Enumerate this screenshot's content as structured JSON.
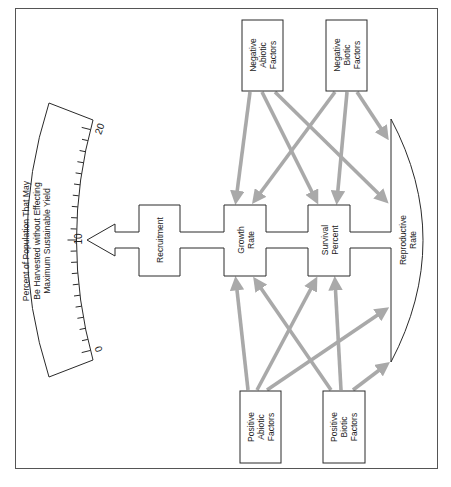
{
  "scale": {
    "label_lines": [
      "Percent of Population That May",
      "Be Harvested without Effecting",
      "Maximum Sustainable Yield"
    ],
    "ticks": [
      "0",
      "10",
      "20"
    ],
    "min": 0,
    "max": 20,
    "pointer_value": 10
  },
  "chain": {
    "recruitment": "Recruitment",
    "growth_rate": [
      "Growth",
      "Rate"
    ],
    "survival_percent": [
      "Survival",
      "Percent"
    ],
    "reproductive_rate": [
      "Reproductive",
      "Rate"
    ]
  },
  "factors": {
    "negative_abiotic": [
      "Negative",
      "Abiotic",
      "Factors"
    ],
    "negative_biotic": [
      "Negative",
      "Biotic",
      "Factors"
    ],
    "positive_abiotic": [
      "Positive",
      "Abiotic",
      "Factors"
    ],
    "positive_biotic": [
      "Positive",
      "Biotic",
      "Factors"
    ]
  },
  "colors": {
    "line": "#2a2a2a",
    "arrow": "#a9a9a9",
    "frame": "#555555"
  },
  "links": [
    {
      "from": "Negative Abiotic Factors",
      "to": "Growth Rate"
    },
    {
      "from": "Negative Abiotic Factors",
      "to": "Survival Percent"
    },
    {
      "from": "Negative Abiotic Factors",
      "to": "Reproductive Rate"
    },
    {
      "from": "Negative Biotic Factors",
      "to": "Growth Rate"
    },
    {
      "from": "Negative Biotic Factors",
      "to": "Survival Percent"
    },
    {
      "from": "Negative Biotic Factors",
      "to": "Reproductive Rate"
    },
    {
      "from": "Positive Abiotic Factors",
      "to": "Growth Rate"
    },
    {
      "from": "Positive Abiotic Factors",
      "to": "Survival Percent"
    },
    {
      "from": "Positive Abiotic Factors",
      "to": "Reproductive Rate"
    },
    {
      "from": "Positive Biotic Factors",
      "to": "Growth Rate"
    },
    {
      "from": "Positive Biotic Factors",
      "to": "Survival Percent"
    },
    {
      "from": "Positive Biotic Factors",
      "to": "Reproductive Rate"
    }
  ]
}
